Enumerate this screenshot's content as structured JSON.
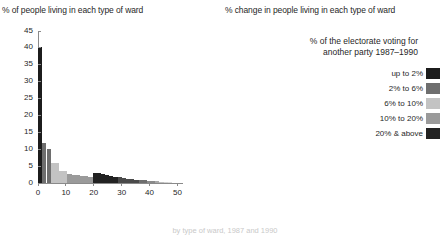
{
  "figure": {
    "caption_bottom": "by type of ward, 1987 and 1990"
  },
  "legend": {
    "title_line1": "% of the electorate voting for",
    "title_line2": "another party 1987–1990",
    "items": [
      {
        "label": "up to 2%",
        "color": "#1c1c1c"
      },
      {
        "label": "2% to 6%",
        "color": "#6e6e6e"
      },
      {
        "label": "6% to 10%",
        "color": "#c3c3c3"
      },
      {
        "label": "10% to 20%",
        "color": "#9a9a9a"
      },
      {
        "label": "20% & above",
        "color": "#222222"
      }
    ]
  },
  "chart_data": [
    {
      "id": "left",
      "type": "bar",
      "title": "% of people living in each type of ward",
      "xlabel": "",
      "ylabel": "",
      "xlim": [
        0,
        52
      ],
      "ylim": [
        0,
        45
      ],
      "yticks": [
        0,
        5,
        10,
        15,
        20,
        25,
        30,
        35,
        40,
        45
      ],
      "xticks": [
        0,
        10,
        20,
        30,
        40,
        50
      ],
      "grid": false,
      "legend_position": "right-panel",
      "x": [
        0.8,
        2.3,
        3.8,
        5.3,
        6.8,
        8.3,
        9.8,
        11.3,
        12.8,
        14.3,
        15.8,
        17.3,
        18.8,
        20.3,
        21.8,
        23.3,
        24.8,
        26.3,
        27.8,
        29.3,
        30.8,
        32.3,
        33.8,
        35.3,
        36.8,
        38.3,
        39.8,
        41.3,
        42.8,
        44.3,
        45.8,
        47.3
      ],
      "values": [
        40.2,
        11.8,
        10.1,
        6.0,
        5.8,
        3.6,
        3.5,
        2.6,
        2.5,
        2.3,
        2.2,
        2.0,
        1.9,
        3.0,
        2.9,
        2.6,
        2.3,
        2.1,
        1.9,
        1.7,
        1.5,
        1.3,
        1.2,
        1.0,
        0.9,
        0.8,
        0.7,
        0.6,
        0.5,
        0.4,
        0.3,
        0.2
      ],
      "bar_colors": [
        "#1c1c1c",
        "#6e6e6e",
        "#6e6e6e",
        "#c3c3c3",
        "#c3c3c3",
        "#c3c3c3",
        "#c3c3c3",
        "#9a9a9a",
        "#9a9a9a",
        "#9a9a9a",
        "#9a9a9a",
        "#9a9a9a",
        "#9a9a9a",
        "#222222",
        "#222222",
        "#222222",
        "#222222",
        "#222222",
        "#222222",
        "#4a4a4a",
        "#4a4a4a",
        "#4a4a4a",
        "#4a4a4a",
        "#4a4a4a",
        "#6e6e6e",
        "#6e6e6e",
        "#8a8a8a",
        "#8a8a8a",
        "#a8a8a8",
        "#bdbdbd",
        "#d2d2d2",
        "#dcdcdc"
      ]
    },
    {
      "id": "right",
      "type": "bar",
      "title": "% change in people living in each type of ward",
      "xlabel": "",
      "ylabel": "",
      "xlim": [
        0,
        52
      ],
      "ylim": [
        -5,
        25
      ],
      "yticks": [
        -5,
        0,
        5,
        10,
        15,
        20,
        25
      ],
      "xticks": [
        0,
        10,
        20,
        30,
        40,
        50
      ],
      "grid": false,
      "legend_position": "top-right",
      "x": [
        0.8,
        2.3,
        3.8,
        5.3,
        6.8,
        8.3,
        9.8,
        11.3,
        12.8,
        14.3,
        15.8,
        17.3,
        18.8,
        20.3,
        21.8,
        23.3,
        24.8,
        26.3,
        27.8,
        29.3,
        30.8,
        32.3,
        33.8,
        35.3,
        36.8,
        38.3,
        39.8,
        41.3,
        42.8,
        44.3,
        45.8,
        47.3
      ],
      "values": [
        23.5,
        -1.5,
        -3.4,
        -4.4,
        -2.0,
        -1.2,
        -0.9,
        -0.8,
        -0.7,
        -0.6,
        -0.6,
        -0.5,
        -0.5,
        0.9,
        0.8,
        0.5,
        0.4,
        0.3,
        0.3,
        0.4,
        0.3,
        0.3,
        0.2,
        0.2,
        0.2,
        0.2,
        0.2,
        0.1,
        0.1,
        0.1,
        0.1,
        0.1
      ],
      "bar_colors": [
        "#1c1c1c",
        "#6e6e6e",
        "#6e6e6e",
        "#6e6e6e",
        "#c3c3c3",
        "#c3c3c3",
        "#c3c3c3",
        "#9a9a9a",
        "#9a9a9a",
        "#9a9a9a",
        "#9a9a9a",
        "#9a9a9a",
        "#9a9a9a",
        "#222222",
        "#222222",
        "#222222",
        "#222222",
        "#3a3a3a",
        "#3a3a3a",
        "#4a4a4a",
        "#4a4a4a",
        "#5a5a5a",
        "#5a5a5a",
        "#6a6a6a",
        "#6a6a6a",
        "#7a7a7a",
        "#8a8a8a",
        "#9a9a9a",
        "#a8a8a8",
        "#b8b8b8",
        "#c8c8c8",
        "#d4d4d4"
      ]
    }
  ]
}
